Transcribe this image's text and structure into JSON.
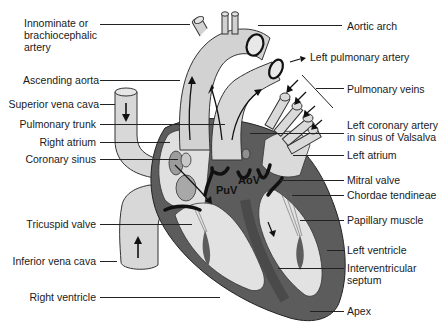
{
  "diagram": {
    "colors": {
      "background": "#ffffff",
      "vessel_fill": "#d4d4d4",
      "chamber_fill": "#e2e2e2",
      "myocardium": "#5a5a5a",
      "valve": "#111111",
      "outline": "#222222",
      "oval": "#9a9a9a"
    },
    "inner_labels": {
      "puv": "PuV",
      "aov": "AoV"
    },
    "labels_left": [
      {
        "id": "innominate",
        "text": "Innominate or\nbrachiocephalic\nartery"
      },
      {
        "id": "ascending-aorta",
        "text": "Ascending aorta"
      },
      {
        "id": "superior-vena-cava",
        "text": "Superior vena cava"
      },
      {
        "id": "pulmonary-trunk",
        "text": "Pulmonary trunk"
      },
      {
        "id": "right-atrium",
        "text": "Right atrium"
      },
      {
        "id": "coronary-sinus",
        "text": "Coronary sinus"
      },
      {
        "id": "tricuspid-valve",
        "text": "Tricuspid valve"
      },
      {
        "id": "inferior-vena-cava",
        "text": "Inferior vena cava"
      },
      {
        "id": "right-ventricle",
        "text": "Right ventricle"
      }
    ],
    "labels_right": [
      {
        "id": "aortic-arch",
        "text": "Aortic arch"
      },
      {
        "id": "left-pulmonary-artery",
        "text": "Left pulmonary artery"
      },
      {
        "id": "pulmonary-veins",
        "text": "Pulmonary veins"
      },
      {
        "id": "left-coronary-artery",
        "text": "Left coronary artery\nin sinus of Valsalva"
      },
      {
        "id": "left-atrium",
        "text": "Left atrium"
      },
      {
        "id": "mitral-valve",
        "text": "Mitral valve"
      },
      {
        "id": "chordae-tendineae",
        "text": "Chordae tendineae"
      },
      {
        "id": "papillary-muscle",
        "text": "Papillary muscle"
      },
      {
        "id": "left-ventricle",
        "text": "Left ventricle"
      },
      {
        "id": "interventricular-septum",
        "text": "Interventricular\nseptum"
      },
      {
        "id": "apex",
        "text": "Apex"
      }
    ]
  }
}
